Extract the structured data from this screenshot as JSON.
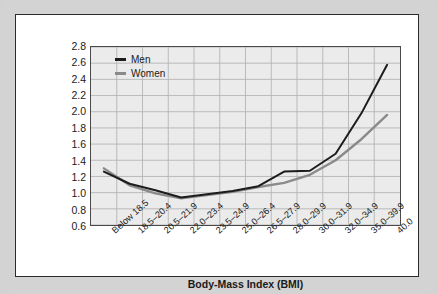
{
  "chart_data": {
    "type": "line",
    "title": "",
    "xlabel": "Body-Mass Index (BMI)",
    "ylabel": "Relative Risk of Death",
    "ylim": [
      0.6,
      2.8
    ],
    "ytick_step": 0.2,
    "yticks": [
      "2.8",
      "2.6",
      "2.4",
      "2.2",
      "2.0",
      "1.8",
      "1.6",
      "1.4",
      "1.2",
      "1.0",
      "0.8",
      "0.6"
    ],
    "grid": true,
    "legend_position": "top-left",
    "categories": [
      "Below 18.5",
      "18.5–20.4",
      "20.5–21.9",
      "22.0–23.4",
      "23.5–24.9",
      "25.0–26.4",
      "26.5–27.9",
      "28.0–29.9",
      "30.0–31.9",
      "32.0–34.9",
      "35.0–39.9",
      "40.0"
    ],
    "series": [
      {
        "name": "Men",
        "color": "#1c1c1c",
        "values": [
          1.26,
          1.11,
          1.03,
          0.94,
          0.98,
          1.02,
          1.08,
          1.26,
          1.27,
          1.48,
          1.98,
          2.58
        ]
      },
      {
        "name": "Women",
        "color": "#8a8a8a",
        "values": [
          1.3,
          1.09,
          0.99,
          0.93,
          0.97,
          1.01,
          1.07,
          1.12,
          1.22,
          1.4,
          1.66,
          1.96
        ]
      }
    ]
  },
  "colors": {
    "panel_background": "#ffffff",
    "outer_frame": "#d3d3d3",
    "plot_background": "#ebebeb",
    "grid_line": "#b4b4b4",
    "axis_line": "#4a4a4a",
    "men_line": "#1c1c1c",
    "women_line": "#8a8a8a",
    "text": "#1a1a1a"
  }
}
